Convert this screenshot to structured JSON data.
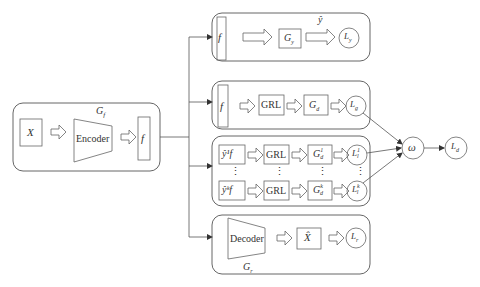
{
  "colors": {
    "stroke": "#555555",
    "text": "#333333",
    "background": "#ffffff"
  },
  "encoder_block": {
    "group_label": "G",
    "group_sub": "f",
    "input_label": "X",
    "encoder_label": "Encoder",
    "feature_label": "f"
  },
  "label_branch": {
    "feature_label": "f",
    "classifier_label": "G",
    "classifier_sub": "y",
    "pred_label": "ŷ",
    "loss_label": "L",
    "loss_sub": "y"
  },
  "global_domain_branch": {
    "feature_label": "f",
    "grl_label": "GRL",
    "disc_label": "G",
    "disc_sub": "d",
    "loss_label": "L",
    "loss_sub": "g"
  },
  "local_domain_branch": {
    "rows": [
      {
        "input_label": "ŷ¹f",
        "grl_label": "GRL",
        "disc_label": "G",
        "disc_sub": "d",
        "disc_sup": "1",
        "loss_label": "L",
        "loss_sub": "l",
        "loss_sup": "1"
      },
      {
        "input_label": "ŷᵏf",
        "grl_label": "GRL",
        "disc_label": "G",
        "disc_sub": "d",
        "disc_sup": "k",
        "loss_label": "L",
        "loss_sub": "l",
        "loss_sup": "k"
      }
    ],
    "ellipsis": "⋮"
  },
  "reconstruction_branch": {
    "decoder_label": "Decoder",
    "group_label": "G",
    "group_sub": "r",
    "output_label": "X̂",
    "loss_label": "L",
    "loss_sub": "r"
  },
  "combiner": {
    "weight_label": "ω",
    "loss_label": "L",
    "loss_sub": "d"
  }
}
